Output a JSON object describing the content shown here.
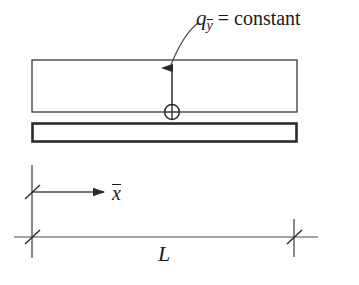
{
  "figure": {
    "background_color": "#ffffff",
    "line_color": "#2b2b2b",
    "text_color": "#1a1a1a",
    "width": 359,
    "height": 285
  },
  "labels": {
    "load": {
      "symbol": "q",
      "subscript": "y",
      "subscript_has_overbar": true,
      "relation": "= constant",
      "full_text": "q_ȳ = constant"
    },
    "axis": {
      "symbol": "x",
      "has_overbar": true,
      "full_text": "x̄"
    },
    "length": {
      "symbol": "L",
      "full_text": "L"
    }
  },
  "shapes": {
    "upper_beam": {
      "name": "upper-beam-rectangle",
      "x": 32,
      "y": 60,
      "width": 265,
      "height": 52,
      "stroke_width": 1.3,
      "fill": "#ffffff"
    },
    "lower_beam": {
      "name": "lower-beam-rectangle",
      "x": 32,
      "y": 123,
      "width": 265,
      "height": 19,
      "stroke_width": 2.6,
      "fill": "#ffffff"
    },
    "load_arrow": {
      "name": "load-arrow",
      "x": 172,
      "y_tail": 112,
      "y_head": 66
    },
    "circle_plus": {
      "name": "circle-plus-marker",
      "cx": 172,
      "cy": 112,
      "r": 7.5
    },
    "leader_curve": {
      "name": "leader-curve",
      "start_x": 172,
      "start_y": 66,
      "end_x": 197,
      "end_y": 22
    },
    "axis_arrow": {
      "name": "x-axis-arrow",
      "x_start": 32,
      "x_end": 106,
      "y": 192
    },
    "origin_line": {
      "name": "origin-vertical-line",
      "x": 32,
      "y_top": 165,
      "y_bottom": 258
    },
    "dimension_line": {
      "name": "length-dimension-line",
      "x_start": 14,
      "x_end": 318,
      "y": 237
    },
    "right_extension_line": {
      "name": "right-extension-line",
      "x": 294,
      "y_top": 219,
      "y_bottom": 257
    },
    "tick_marks": [
      {
        "name": "origin-upper-slash-tick",
        "cx": 32,
        "cy": 192
      },
      {
        "name": "origin-lower-slash-tick",
        "cx": 32,
        "cy": 237
      },
      {
        "name": "right-slash-tick",
        "cx": 294,
        "cy": 237
      }
    ]
  }
}
